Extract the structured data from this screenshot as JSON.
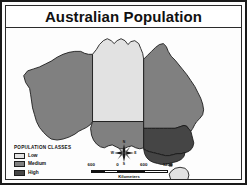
{
  "map": {
    "title": "Australian Population",
    "legend": {
      "title": "POPULATION CLASSES",
      "classes": [
        {
          "label": "Low",
          "color": "#e2e2e2"
        },
        {
          "label": "Medium",
          "color": "#808080"
        },
        {
          "label": "High",
          "color": "#454545"
        }
      ]
    },
    "compass": {
      "north": "N",
      "south": "S",
      "east": "E",
      "west": "W"
    },
    "scale": {
      "ticks": [
        "600",
        "0",
        "600",
        "1200"
      ],
      "units": "Kilometers"
    },
    "regions": [
      {
        "name": "Western Australia",
        "class": "Medium"
      },
      {
        "name": "Northern Territory",
        "class": "Low"
      },
      {
        "name": "South Australia",
        "class": "Medium"
      },
      {
        "name": "Queensland",
        "class": "Medium"
      },
      {
        "name": "New South Wales",
        "class": "High"
      },
      {
        "name": "Victoria",
        "class": "High"
      },
      {
        "name": "Tasmania",
        "class": "Low"
      }
    ],
    "colors": {
      "low": "#e2e2e2",
      "medium": "#808080",
      "high": "#454545",
      "outline": "#1a1a1a",
      "background": "#fdfdfd",
      "frame": "#1a1a1a"
    }
  }
}
